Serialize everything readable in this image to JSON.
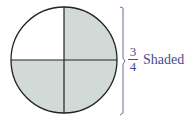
{
  "diagram": {
    "shape": "circle",
    "parts": 4,
    "shaded_parts": 3,
    "unshaded_part": "top-left",
    "colors": {
      "shaded_fill": "#d2dad7",
      "outline": "#222222",
      "annotation": "#4a4a8c"
    }
  },
  "annotation": {
    "numerator": "3",
    "denominator": "4",
    "label": "Shaded"
  }
}
